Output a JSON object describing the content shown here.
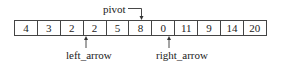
{
  "array": {
    "values": [
      "4",
      "3",
      "2",
      "2",
      "5",
      "8",
      "0",
      "11",
      "9",
      "14",
      "20"
    ]
  },
  "pointers": {
    "pivot": {
      "label": "pivot",
      "index": 5
    },
    "left": {
      "label": "left_arrow",
      "index": 3
    },
    "right": {
      "label": "right_arrow",
      "index": 6
    }
  }
}
